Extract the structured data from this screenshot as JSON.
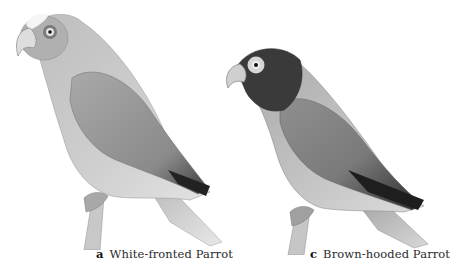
{
  "figure": {
    "panels": [
      {
        "letter": "a",
        "caption": "White-fronted Parrot",
        "description": "Grayscale illustration of a parrot perched on a branch, facing left, pale forehead and grey body"
      },
      {
        "letter": "c",
        "caption": "Brown-hooded Parrot",
        "description": "Grayscale illustration of a parrot perched on a branch, facing left, dark hood and pale eye-ring"
      }
    ],
    "colors": {
      "background": "#ffffff",
      "caption_text": "#2a2a2a"
    }
  }
}
